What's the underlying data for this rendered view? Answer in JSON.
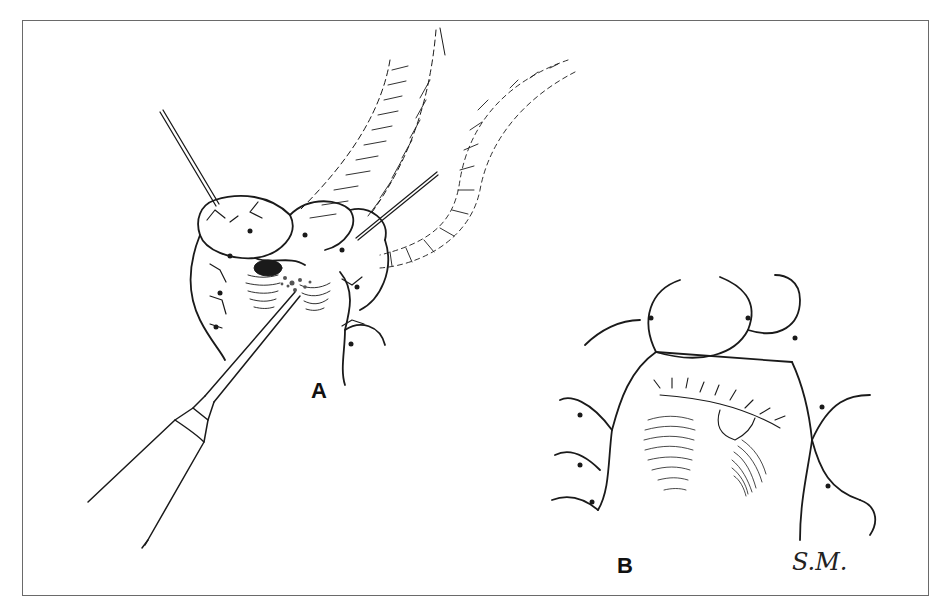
{
  "figure": {
    "panel_labels": {
      "a": "A",
      "b": "B"
    },
    "signature": "S.M.",
    "colors": {
      "ink": "#1a1a1a",
      "frame": "#6a6a6a",
      "background": "#ffffff"
    }
  }
}
